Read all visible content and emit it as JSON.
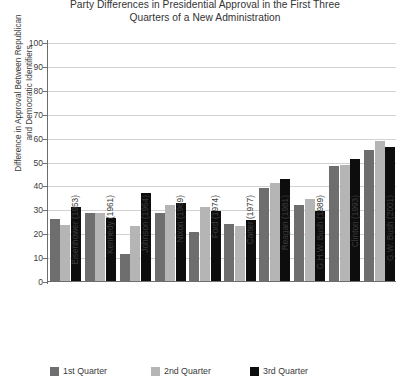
{
  "chart_data": {
    "type": "bar",
    "title": "Party Differences in Presidential Approval in the First Three Quarters of a New Administration",
    "title_lines": [
      "Party Differences in Presidential Approval in the First Three",
      "Quarters of a New Administration"
    ],
    "xlabel": "",
    "ylabel": "Difference in Approval Between Republican and Democratic Identifiers",
    "ylabel_lines": [
      "Difference in Approval Between Republican",
      "and Democratic Identifiers"
    ],
    "ylim": [
      0,
      100
    ],
    "ytick_step": 10,
    "yticks": [
      100,
      90,
      80,
      70,
      60,
      50,
      40,
      30,
      20,
      10,
      0
    ],
    "grid": true,
    "legend_position": "bottom-left",
    "categories": [
      "Eisenhower (1953)",
      "Kennedy (1961)",
      "Johnson (1964)",
      "Nixon (1969)",
      "Ford (1974)",
      "Carter (1977)",
      "Reagan (1981)",
      "G.H.W. Bush (1989)",
      "Clinton (1993)",
      "G.W. Bush (2001)"
    ],
    "series": [
      {
        "name": "1st Quarter",
        "color": "#6e6e6e",
        "values": [
          26,
          28.5,
          11.5,
          28.5,
          20.5,
          24,
          39,
          32,
          48,
          55
        ]
      },
      {
        "name": "2nd Quarter",
        "color": "#b5b5b5",
        "values": [
          23.5,
          28.5,
          23,
          32,
          31,
          23,
          41,
          34.5,
          48.5,
          58.5
        ]
      },
      {
        "name": "3rd Quarter",
        "color": "#0d0d0d",
        "values": [
          31,
          26.5,
          37,
          32.5,
          29.5,
          25.5,
          42.5,
          29.5,
          51,
          56
        ]
      }
    ]
  },
  "legend": {
    "items": [
      {
        "label": "1st Quarter",
        "key": "q1"
      },
      {
        "label": "2nd Quarter",
        "key": "q2"
      },
      {
        "label": "3rd Quarter",
        "key": "q3"
      }
    ]
  },
  "colors": {
    "q1": "#6e6e6e",
    "q2": "#b5b5b5",
    "q3": "#0d0d0d",
    "axis": "#6d6d6d",
    "grid": "#d2d2d2",
    "text": "#3c3c3c",
    "background": "#ffffff"
  }
}
